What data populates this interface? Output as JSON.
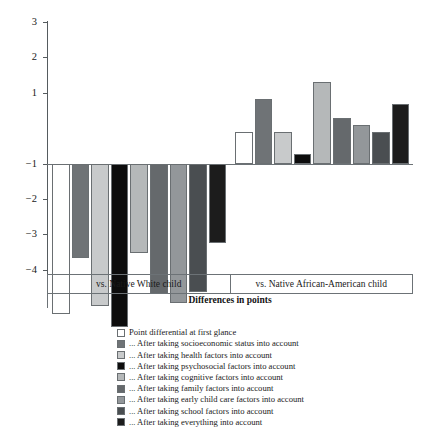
{
  "chart_data": {
    "type": "bar",
    "title": "",
    "xlabel": "Differences in points",
    "ylabel": "",
    "ylim": [
      -5,
      3
    ],
    "yticks": [
      3,
      2,
      1,
      -1,
      -2,
      -3,
      -4
    ],
    "ytick_labels": [
      "3",
      "2",
      "1",
      "−1",
      "−2",
      "−3",
      "−4"
    ],
    "baseline_value": -1,
    "grid": false,
    "legend_position": "below",
    "categories": [
      "vs. Native White child",
      "vs. Native African-American child"
    ],
    "series": [
      {
        "name": "Point differential at first glance",
        "color": "#ffffff",
        "values": [
          -4.25,
          0.88
        ]
      },
      {
        "name": "... After taking socioeconomic status into account",
        "color": "#6f7376",
        "values": [
          -2.67,
          1.82
        ]
      },
      {
        "name": "... After taking health factors into account",
        "color": "#c8cacb",
        "values": [
          -4.03,
          0.88
        ]
      },
      {
        "name": "... After taking psychosocial factors into account",
        "color": "#0d0d0d",
        "values": [
          -4.63,
          0.27
        ]
      },
      {
        "name": "... After taking cognitive factors into account",
        "color": "#b5b8b9",
        "values": [
          -2.53,
          2.3
        ]
      },
      {
        "name": "... After taking family factors into account",
        "color": "#65696c",
        "values": [
          -3.67,
          1.28
        ]
      },
      {
        "name": "... After taking early child care factors into account",
        "color": "#93979a",
        "values": [
          -3.95,
          1.08
        ]
      },
      {
        "name": "... After taking school factors into account",
        "color": "#4a4e51",
        "values": [
          -3.63,
          0.88
        ]
      },
      {
        "name": "... After taking everything into account",
        "color": "#1c1c1c",
        "values": [
          -2.25,
          1.67
        ]
      }
    ]
  }
}
